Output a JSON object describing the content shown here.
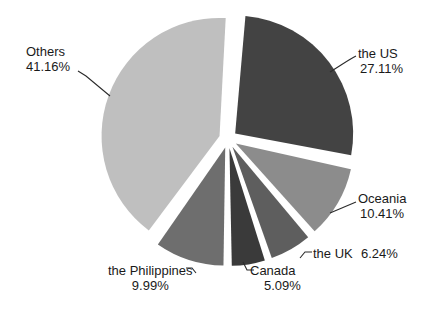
{
  "chart_data": {
    "type": "pie",
    "title": "",
    "legend_position": "none",
    "labels_inline": true,
    "exploded": true,
    "categories": [
      "the US",
      "Oceania",
      "the UK",
      "Canada",
      "the Philippines",
      "Others"
    ],
    "values": [
      27.11,
      10.41,
      6.24,
      5.09,
      9.99,
      41.16
    ],
    "value_suffix": "%",
    "colors": [
      "#434343",
      "#8c8c8c",
      "#5e5e5e",
      "#3a3a3a",
      "#6e6e6e",
      "#bfbfbf"
    ],
    "slices": [
      {
        "name": "the US",
        "value": 27.11,
        "value_text": "27.11%",
        "color": "#434343"
      },
      {
        "name": "Oceania",
        "value": 10.41,
        "value_text": "10.41%",
        "color": "#8c8c8c"
      },
      {
        "name": "the UK",
        "value": 6.24,
        "value_text": "6.24%",
        "color": "#5e5e5e"
      },
      {
        "name": "Canada",
        "value": 5.09,
        "value_text": "5.09%",
        "color": "#3a3a3a"
      },
      {
        "name": "the Philippines",
        "value": 9.99,
        "value_text": "9.99%",
        "color": "#6e6e6e"
      },
      {
        "name": "Others",
        "value": 41.16,
        "value_text": "41.16%",
        "color": "#bfbfbf"
      }
    ]
  },
  "labels": {
    "us": {
      "name": "the US",
      "pct": "27.11%"
    },
    "oceania": {
      "name": "Oceania",
      "pct": "10.41%"
    },
    "uk": {
      "name": "the UK",
      "pct": "6.24%"
    },
    "canada": {
      "name": "Canada",
      "pct": "5.09%"
    },
    "phil": {
      "name": "the Philippines",
      "pct": "9.99%"
    },
    "others": {
      "name": "Others",
      "pct": "41.16%"
    }
  }
}
